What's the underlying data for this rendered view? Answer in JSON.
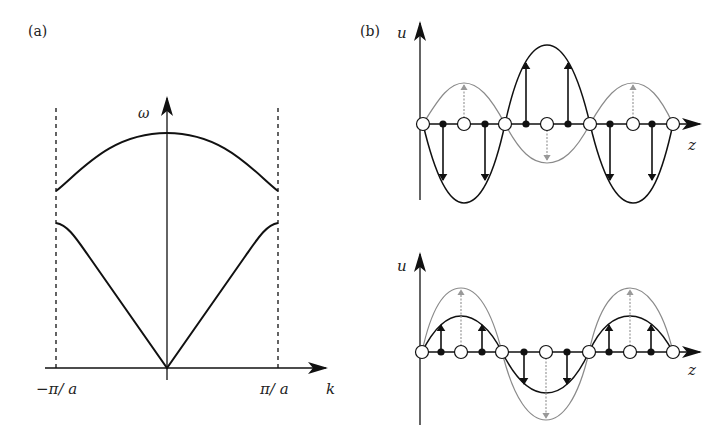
{
  "panel_a": {
    "label": "(a)",
    "y_axis_label": "ω",
    "x_axis_label": "k",
    "left_boundary_label": "−π/ a",
    "right_boundary_label": "π/ a",
    "curves": [
      {
        "name": "optical branch",
        "description": "upper dispersion curve, max at k=0, decreasing toward ±π/a"
      },
      {
        "name": "acoustic branch",
        "description": "lower dispersion curve, zero at k=0, rising to ±π/a"
      }
    ]
  },
  "panel_b": {
    "label": "(b)",
    "top": {
      "y_axis_label": "u",
      "x_axis_label": "z",
      "description": "short-wavelength mode: filled atoms displaced with large amplitude (black sine), open atoms with smaller amplitude opposite (gray sine)"
    },
    "bottom": {
      "y_axis_label": "u",
      "x_axis_label": "z",
      "description": "in-phase mode: filled atoms smaller amplitude (black sine), open atoms larger amplitude (gray sine), same phase"
    }
  },
  "colors": {
    "ink": "#111111",
    "gray_curve": "#8a8a8a",
    "background": "#ffffff"
  }
}
